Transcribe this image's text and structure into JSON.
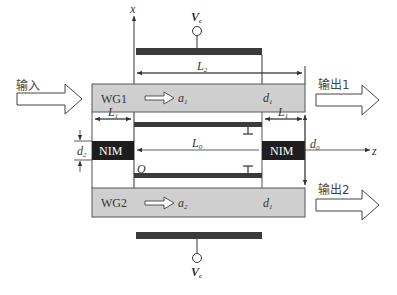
{
  "diagram": {
    "type": "waveguide-coupler-schematic",
    "axes": {
      "vertical": "x",
      "horizontal": "z",
      "origin": "O"
    },
    "input": {
      "label": "输入"
    },
    "outputs": [
      {
        "label": "输出1"
      },
      {
        "label": "输出2"
      }
    ],
    "waveguides": [
      {
        "name": "WG1",
        "mode": "a",
        "mode_sub": "1",
        "thickness": "d",
        "thickness_sub": "1"
      },
      {
        "name": "WG2",
        "mode": "a",
        "mode_sub": "2",
        "thickness": "d",
        "thickness_sub": "1"
      }
    ],
    "nim_blocks": [
      {
        "label": "NIM",
        "side": "left"
      },
      {
        "label": "NIM",
        "side": "right"
      }
    ],
    "dimensions": {
      "L1_left": {
        "sym": "L",
        "sub": "1"
      },
      "L1_right": {
        "sym": "L",
        "sub": "1"
      },
      "L0": {
        "sym": "L",
        "sub": "0"
      },
      "L2": {
        "sym": "L",
        "sub": "2"
      },
      "d2": {
        "sym": "d",
        "sub": "2"
      },
      "d0": {
        "sym": "d",
        "sub": "0"
      }
    },
    "voltage": {
      "top": {
        "sym": "V",
        "sub": "c"
      },
      "bottom": {
        "sym": "V",
        "sub": "c"
      }
    },
    "colors": {
      "waveguide_fill": "#cfcfcf",
      "nim_fill": "#1e1e1e",
      "electrode": "#3a3a3a",
      "line": "#333333"
    }
  }
}
